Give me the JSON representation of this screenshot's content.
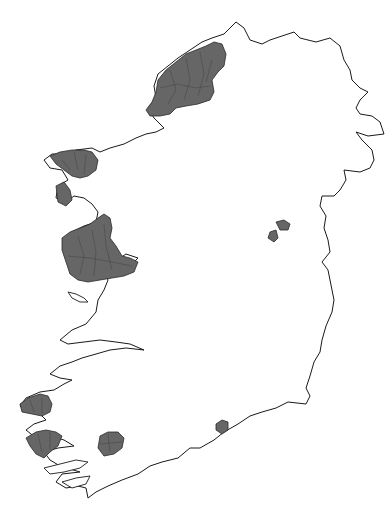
{
  "map": {
    "title": "Gaeltacht areas of Ireland",
    "country": "Ireland",
    "colors": {
      "background": "#ffffff",
      "coastline": "#1a1a1a",
      "shaded_region": "#666666",
      "region_border": "#2a2a2a"
    },
    "regions": [
      {
        "id": "donegal",
        "label": "Donegal"
      },
      {
        "id": "mayo-north",
        "label": "North Mayo"
      },
      {
        "id": "achill",
        "label": "Achill / West Mayo"
      },
      {
        "id": "galway",
        "label": "Galway / Connemara"
      },
      {
        "id": "meath",
        "label": "Meath"
      },
      {
        "id": "kerry-iveragh",
        "label": "Kerry (Iveragh)"
      },
      {
        "id": "kerry-dingle",
        "label": "Kerry (Dingle)"
      },
      {
        "id": "cork",
        "label": "Cork (Múscraí)"
      },
      {
        "id": "waterford",
        "label": "Waterford"
      }
    ]
  }
}
